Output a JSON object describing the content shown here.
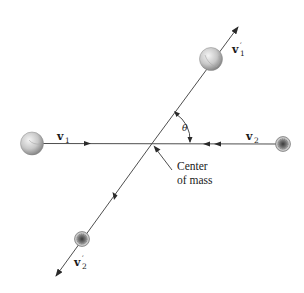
{
  "diagram": {
    "labels": {
      "v1": {
        "main": "v",
        "sub": "1",
        "prime": ""
      },
      "v2": {
        "main": "v",
        "sub": "2",
        "prime": ""
      },
      "v1_prime": {
        "main": "v",
        "sub": "1",
        "prime": "′"
      },
      "v2_prime": {
        "main": "v",
        "sub": "2",
        "prime": "′"
      },
      "theta": "θ",
      "center_of_mass_line1": "Center",
      "center_of_mass_line2": "of mass"
    },
    "objects": [
      {
        "id": "ball-1-initial",
        "kind": "large-ball",
        "position": "left"
      },
      {
        "id": "ball-2-initial",
        "kind": "small-textured-ball",
        "position": "right"
      },
      {
        "id": "ball-1-final",
        "kind": "large-ball",
        "position": "upper-right"
      },
      {
        "id": "ball-2-final",
        "kind": "small-textured-ball",
        "position": "lower-left"
      }
    ],
    "colors": {
      "line": "#3a3a3a",
      "text": "#1a1a1a",
      "ball_light": "#f2f2f2",
      "ball_dark": "#8a8a8a",
      "small_ball_dark": "#4a4a4a"
    }
  }
}
